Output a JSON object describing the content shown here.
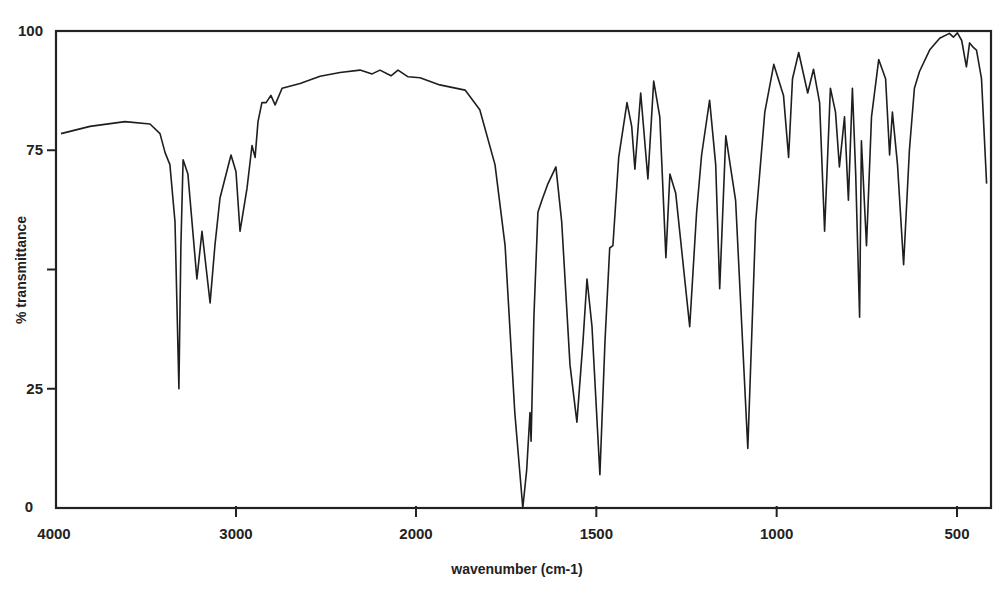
{
  "chart_data": {
    "type": "line",
    "title": "",
    "xlabel": "wavenumber (cm-1)",
    "ylabel": "% transmittance",
    "xlim": [
      4000,
      400
    ],
    "ylim": [
      0,
      100
    ],
    "x_scale_note": "split scale: 4000-2000 compressed, 2000-400 expanded (2x)",
    "x_ticks": [
      4000,
      3000,
      2000,
      1500,
      1000,
      500
    ],
    "x_tick_labels": [
      "4000",
      "3000",
      "2000",
      "1500",
      "1000",
      "500"
    ],
    "y_ticks": [
      0,
      25,
      50,
      75,
      100
    ],
    "y_tick_labels": [
      "0",
      "25",
      "",
      "75",
      "100"
    ],
    "grid": false,
    "legend": null,
    "line_color": "#1e1e1e",
    "series": [
      {
        "name": "IR spectrum",
        "x": [
          3972,
          3811,
          3617,
          3478,
          3422,
          3394,
          3367,
          3339,
          3317,
          3306,
          3294,
          3267,
          3217,
          3189,
          3144,
          3117,
          3089,
          3028,
          3000,
          2978,
          2939,
          2911,
          2894,
          2878,
          2856,
          2833,
          2806,
          2783,
          2744,
          2644,
          2533,
          2422,
          2311,
          2244,
          2200,
          2139,
          2100,
          2044,
          1989,
          1934,
          1864,
          1823,
          1781,
          1753,
          1726,
          1704,
          1693,
          1684,
          1681,
          1673,
          1662,
          1651,
          1634,
          1612,
          1596,
          1573,
          1554,
          1537,
          1526,
          1512,
          1490,
          1476,
          1463,
          1454,
          1438,
          1415,
          1402,
          1393,
          1377,
          1357,
          1341,
          1324,
          1307,
          1296,
          1280,
          1241,
          1222,
          1208,
          1186,
          1169,
          1158,
          1141,
          1114,
          1080,
          1058,
          1033,
          1008,
          981,
          967,
          956,
          939,
          914,
          898,
          881,
          867,
          851,
          837,
          826,
          812,
          801,
          790,
          781,
          770,
          765,
          751,
          737,
          717,
          698,
          687,
          679,
          665,
          648,
          632,
          618,
          604,
          576,
          548,
          521,
          510,
          499,
          487,
          474,
          465,
          454,
          446,
          432,
          418
        ],
        "y": [
          78.5,
          80,
          81,
          80.5,
          78.5,
          74.5,
          72,
          60,
          25,
          55,
          73,
          70,
          48,
          58,
          43,
          55,
          65,
          74,
          70.5,
          58,
          67,
          76,
          73.5,
          81,
          85,
          85,
          86.5,
          84.5,
          88,
          89,
          90.5,
          91.3,
          91.8,
          91,
          91.8,
          90.6,
          91.8,
          90.4,
          90.2,
          88.7,
          87.6,
          83.5,
          72,
          55,
          20,
          0,
          8,
          20,
          14,
          40,
          62,
          64.5,
          68,
          71.5,
          60,
          30,
          18,
          35,
          48,
          38,
          7,
          35,
          54.5,
          55,
          73.5,
          85,
          80,
          71,
          87,
          69,
          89.5,
          82,
          52.5,
          70,
          66,
          38,
          62,
          74,
          85.5,
          72,
          46,
          78,
          64.5,
          12.5,
          60,
          83,
          93,
          86.5,
          73.5,
          90,
          95.5,
          87,
          92,
          85,
          58,
          88,
          83,
          71.5,
          82,
          64.5,
          88,
          70,
          40,
          77,
          55,
          82,
          94,
          90,
          74,
          83,
          72,
          51,
          75,
          88,
          91.5,
          96,
          98.5,
          99.5,
          98.7,
          99.6,
          98,
          92.5,
          97.5,
          96.5,
          96,
          90,
          68
        ]
      }
    ]
  }
}
